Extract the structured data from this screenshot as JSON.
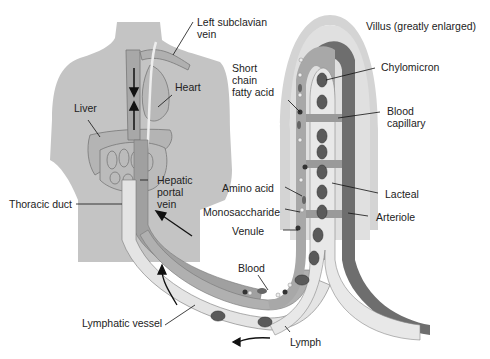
{
  "diagram": {
    "title": "Villus (greatly enlarged)",
    "labels": {
      "left_subclavian_vein": "Left subclavian vein",
      "left_subclavian_vein_l1": "Left subclavian",
      "left_subclavian_vein_l2": "vein",
      "heart": "Heart",
      "liver": "Liver",
      "hepatic_portal_vein_l1": "Hepatic",
      "hepatic_portal_vein_l2": "portal",
      "hepatic_portal_vein_l3": "vein",
      "thoracic_duct": "Thoracic duct",
      "lymphatic_vessel": "Lymphatic vessel",
      "blood": "Blood",
      "lymph": "Lymph",
      "short_chain_l1": "Short",
      "short_chain_l2": "chain",
      "short_chain_l3": "fatty acid",
      "chylomicron": "Chylomicron",
      "blood_capillary_l1": "Blood",
      "blood_capillary_l2": "capillary",
      "amino_acid": "Amino acid",
      "monosaccharide": "Monosaccharide",
      "venule": "Venule",
      "lacteal": "Lacteal",
      "arteriole": "Arteriole"
    },
    "colors": {
      "body": "#c4c4c4",
      "villus_outer": "#d4d4d4",
      "arteriole": "#6e6e6e",
      "venule": "#a8a8a8",
      "lacteal": "#e6e6e6",
      "chylomicron": "#5a5a5a"
    }
  }
}
